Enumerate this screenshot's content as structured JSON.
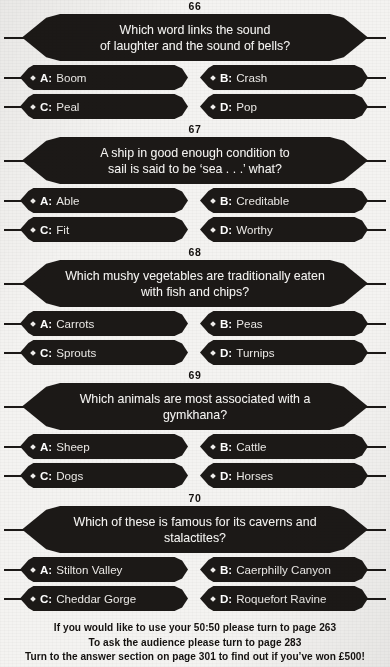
{
  "page": {
    "page_number": "104",
    "background_color": "#f4f3f1",
    "ink_color": "#1c1917"
  },
  "questions": [
    {
      "number": "66",
      "text_lines": [
        "Which word links the sound",
        "of laughter and the sound of bells?"
      ],
      "answers": [
        {
          "letter": "A:",
          "text": "Boom"
        },
        {
          "letter": "B:",
          "text": "Crash"
        },
        {
          "letter": "C:",
          "text": "Peal"
        },
        {
          "letter": "D:",
          "text": "Pop"
        }
      ]
    },
    {
      "number": "67",
      "text_lines": [
        "A ship in good enough condition to",
        "sail is said to be ‘sea . . .’ what?"
      ],
      "answers": [
        {
          "letter": "A:",
          "text": "Able"
        },
        {
          "letter": "B:",
          "text": "Creditable"
        },
        {
          "letter": "C:",
          "text": "Fit"
        },
        {
          "letter": "D:",
          "text": "Worthy"
        }
      ]
    },
    {
      "number": "68",
      "text_lines": [
        "Which mushy vegetables are traditionally eaten",
        "with fish and chips?"
      ],
      "answers": [
        {
          "letter": "A:",
          "text": "Carrots"
        },
        {
          "letter": "B:",
          "text": "Peas"
        },
        {
          "letter": "C:",
          "text": "Sprouts"
        },
        {
          "letter": "D:",
          "text": "Turnips"
        }
      ]
    },
    {
      "number": "69",
      "text_lines": [
        "Which animals are most associated with a gymkhana?"
      ],
      "answers": [
        {
          "letter": "A:",
          "text": "Sheep"
        },
        {
          "letter": "B:",
          "text": "Cattle"
        },
        {
          "letter": "C:",
          "text": "Dogs"
        },
        {
          "letter": "D:",
          "text": "Horses"
        }
      ]
    },
    {
      "number": "70",
      "text_lines": [
        "Which of these is famous for its caverns and stalactites?"
      ],
      "answers": [
        {
          "letter": "A:",
          "text": "Stilton Valley"
        },
        {
          "letter": "B:",
          "text": "Caerphilly Canyon"
        },
        {
          "letter": "C:",
          "text": "Cheddar Gorge"
        },
        {
          "letter": "D:",
          "text": "Roquefort Ravine"
        }
      ]
    }
  ],
  "footer": {
    "line1": "If you would like to use your 50:50 please turn to page 263",
    "line2": "To ask the audience please turn to page 283",
    "line3": "Turn to the answer section on page 301 to find out if you’ve won £500!"
  }
}
